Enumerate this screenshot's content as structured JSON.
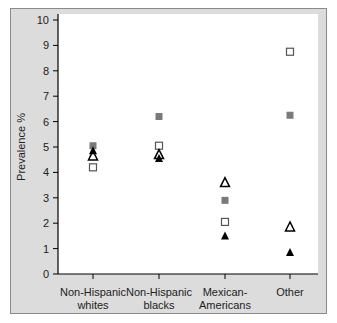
{
  "chart_data": {
    "type": "scatter",
    "title": "",
    "xlabel": "",
    "ylabel": "Prevalence %",
    "ylim": [
      0,
      10
    ],
    "yticks": [
      0,
      1,
      2,
      3,
      4,
      5,
      6,
      7,
      8,
      9,
      10
    ],
    "grid": false,
    "legend": null,
    "categories": [
      "Non-Hispanic whites",
      "Non-Hispanic blacks",
      "Mexican-Americans",
      "Other"
    ],
    "category_label_lines": [
      [
        "Non-Hispanic",
        "whites"
      ],
      [
        "Non-Hispanic",
        "blacks"
      ],
      [
        "Mexican-",
        "Americans"
      ],
      [
        "Other",
        ""
      ]
    ],
    "series": [
      {
        "name": "gray filled square",
        "marker": "square-filled",
        "color": "#7a7a7a",
        "values": [
          5.05,
          6.2,
          2.9,
          6.25
        ]
      },
      {
        "name": "open square",
        "marker": "square-open",
        "color": "#555555",
        "values": [
          4.2,
          5.05,
          2.05,
          8.75
        ]
      },
      {
        "name": "open triangle",
        "marker": "triangle-open",
        "color": "#000000",
        "values": [
          4.65,
          4.7,
          3.6,
          1.85
        ]
      },
      {
        "name": "filled triangle",
        "marker": "triangle-filled",
        "color": "#000000",
        "values": [
          4.85,
          4.55,
          1.5,
          0.85
        ]
      }
    ]
  }
}
